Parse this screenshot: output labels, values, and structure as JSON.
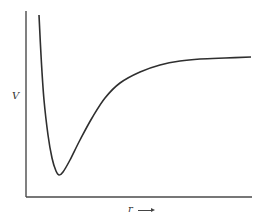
{
  "chart_data": {
    "type": "line",
    "title": "",
    "xlabel": "r",
    "ylabel": "V",
    "xlabel_arrow": "→",
    "grid": false,
    "legend": null,
    "ticks": false,
    "series": [
      {
        "name": "V(r)",
        "points_px": [
          [
            39,
            15
          ],
          [
            41,
            55
          ],
          [
            44,
            100
          ],
          [
            48,
            135
          ],
          [
            52,
            158
          ],
          [
            56,
            171
          ],
          [
            59,
            175
          ],
          [
            63,
            172
          ],
          [
            70,
            160
          ],
          [
            80,
            140
          ],
          [
            92,
            118
          ],
          [
            105,
            98
          ],
          [
            120,
            83
          ],
          [
            140,
            72
          ],
          [
            160,
            65
          ],
          [
            180,
            61
          ],
          [
            200,
            59
          ],
          [
            225,
            58
          ],
          [
            251,
            57
          ]
        ],
        "features": {
          "steep_repulsive_wall_at_small_r": true,
          "minimum_px": [
            59,
            175
          ],
          "asymptote_px_y": 57
        }
      }
    ],
    "axes_px": {
      "origin": [
        26,
        197
      ],
      "y_top": 11,
      "x_right": 252
    }
  },
  "labels": {
    "y": "V",
    "x": "r"
  }
}
